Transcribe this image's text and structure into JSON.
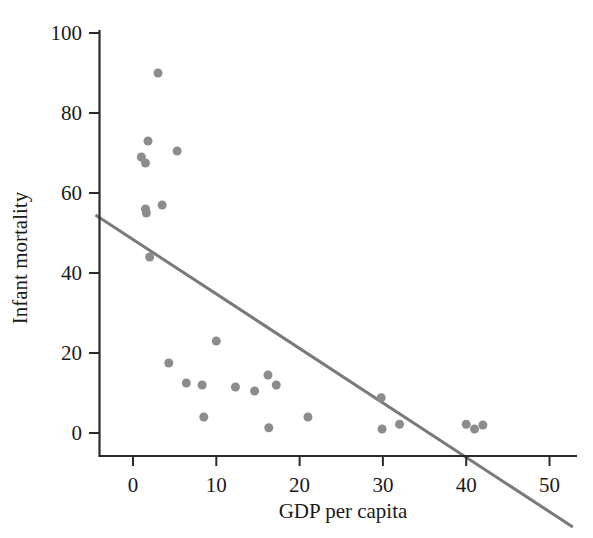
{
  "chart_data": {
    "type": "scatter",
    "title": "",
    "xlabel": "GDP per capita",
    "ylabel": "Infant mortality",
    "xlim": [
      -4.5,
      53
    ],
    "ylim": [
      -7,
      104
    ],
    "xticks": [
      0,
      10,
      20,
      30,
      40,
      50
    ],
    "yticks": [
      0,
      20,
      40,
      60,
      80,
      100
    ],
    "xtick_labels": [
      "0",
      "10",
      "20",
      "30",
      "40",
      "50"
    ],
    "ytick_labels": [
      "0",
      "20",
      "40",
      "60",
      "80",
      "100"
    ],
    "grid": false,
    "legend": null,
    "marker_color": "#8c8c8c",
    "marker_size": 9,
    "points": [
      {
        "x": 3.0,
        "y": 90.0
      },
      {
        "x": 1.8,
        "y": 73.0
      },
      {
        "x": 5.3,
        "y": 70.5
      },
      {
        "x": 1.0,
        "y": 69.0
      },
      {
        "x": 1.5,
        "y": 67.5
      },
      {
        "x": 3.5,
        "y": 57.0
      },
      {
        "x": 1.5,
        "y": 56.0
      },
      {
        "x": 1.6,
        "y": 55.0
      },
      {
        "x": 2.0,
        "y": 44.0
      },
      {
        "x": 10.0,
        "y": 23.0
      },
      {
        "x": 4.3,
        "y": 17.5
      },
      {
        "x": 16.2,
        "y": 14.5
      },
      {
        "x": 6.4,
        "y": 12.5
      },
      {
        "x": 8.3,
        "y": 12.0
      },
      {
        "x": 17.2,
        "y": 12.0
      },
      {
        "x": 12.3,
        "y": 11.5
      },
      {
        "x": 14.6,
        "y": 10.5
      },
      {
        "x": 29.8,
        "y": 8.8
      },
      {
        "x": 8.5,
        "y": 4.0
      },
      {
        "x": 21.0,
        "y": 4.0
      },
      {
        "x": 32.0,
        "y": 2.2
      },
      {
        "x": 40.0,
        "y": 2.2
      },
      {
        "x": 42.0,
        "y": 2.0
      },
      {
        "x": 16.3,
        "y": 1.3
      },
      {
        "x": 29.9,
        "y": 1.0
      },
      {
        "x": 41.0,
        "y": 1.0
      }
    ],
    "fit_line": {
      "color": "#7a7a7a",
      "x_start": -4.5,
      "y_start": 54.5,
      "x_end": 52.8,
      "y_end": -23.5,
      "x_intercept": 39.0
    }
  }
}
